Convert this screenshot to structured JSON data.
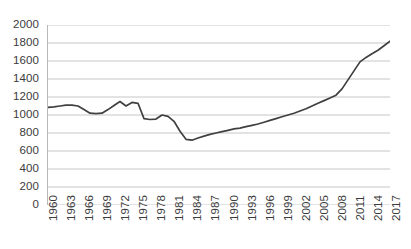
{
  "chart_data": {
    "type": "line",
    "title": "",
    "subtitle": "",
    "xlabel": "",
    "ylabel": "",
    "grid": "horizontal",
    "legend": "none",
    "line_color": "#404040",
    "grid_color": "#bfbfbf",
    "axis_color": "#b8b8b8",
    "ylim": [
      0,
      2000
    ],
    "yticks": [
      2000,
      1800,
      1600,
      1400,
      1200,
      1000,
      800,
      600,
      400,
      200,
      0
    ],
    "xlim": [
      1960,
      2017
    ],
    "xticks": [
      "1960",
      "1963",
      "1966",
      "1969",
      "1972",
      "1975",
      "1978",
      "1981",
      "1984",
      "1987",
      "1990",
      "1993",
      "1996",
      "1999",
      "2002",
      "2005",
      "2008",
      "2011",
      "2014",
      "2017"
    ],
    "x": [
      1960,
      1961,
      1962,
      1963,
      1964,
      1965,
      1966,
      1967,
      1968,
      1969,
      1970,
      1971,
      1972,
      1973,
      1974,
      1975,
      1976,
      1977,
      1978,
      1979,
      1980,
      1981,
      1982,
      1983,
      1984,
      1985,
      1986,
      1987,
      1988,
      1989,
      1990,
      1991,
      1992,
      1993,
      1994,
      1995,
      1996,
      1997,
      1998,
      1999,
      2000,
      2001,
      2002,
      2003,
      2004,
      2005,
      2006,
      2007,
      2008,
      2009,
      2010,
      2011,
      2012,
      2013,
      2014,
      2015,
      2016,
      2017
    ],
    "values": [
      1085,
      1090,
      1100,
      1110,
      1110,
      1100,
      1060,
      1020,
      1015,
      1020,
      1060,
      1105,
      1150,
      1100,
      1140,
      1130,
      960,
      950,
      955,
      1000,
      985,
      930,
      820,
      730,
      720,
      745,
      765,
      785,
      800,
      815,
      830,
      845,
      855,
      870,
      885,
      900,
      920,
      940,
      960,
      980,
      1000,
      1020,
      1045,
      1070,
      1100,
      1130,
      1160,
      1190,
      1220,
      1290,
      1390,
      1490,
      1590,
      1640,
      1680,
      1720,
      1770,
      1820
    ]
  }
}
